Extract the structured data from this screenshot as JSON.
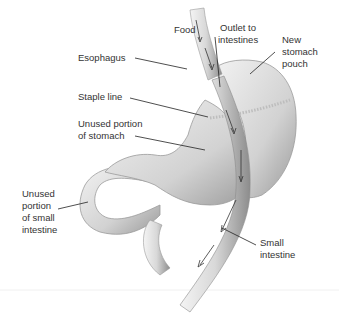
{
  "labels": {
    "food": "Food",
    "outlet": "Outlet to\nintestines",
    "pouch": "New\nstomach\npouch",
    "esophagus": "Esophagus",
    "staple": "Staple line",
    "unused_stomach": "Unused portion\nof stomach",
    "unused_intestine": "Unused\nportion\nof small\nintestine",
    "small_intestine": "Small\nintestine"
  },
  "colors": {
    "organ_light": "#eeeeee",
    "organ_mid": "#c8c8c8",
    "organ_dark": "#8a8a8a",
    "text": "#333333",
    "leader": "#222222"
  }
}
